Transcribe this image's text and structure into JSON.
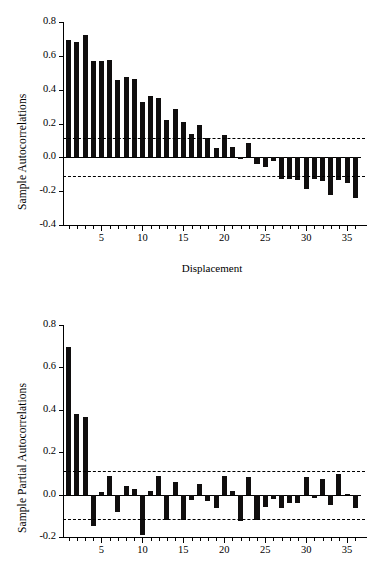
{
  "figure": {
    "background": "#ffffff",
    "bar_color": "#100e0e",
    "axis_color": "#000000"
  },
  "chart_data": [
    {
      "type": "bar",
      "name": "sample-autocorrelations",
      "title": "",
      "ylabel": "Sample Autocorrelations",
      "xlabel": "Displacement",
      "ylim": [
        -0.4,
        0.8
      ],
      "xlim": [
        0.3,
        36.7
      ],
      "grid": false,
      "legend": null,
      "ytick_labels": [
        "0.8",
        "0.6",
        "0.4",
        "0.2",
        "0.0",
        "-0.2",
        "-0.4"
      ],
      "ytick_values": [
        0.8,
        0.6,
        0.4,
        0.2,
        0.0,
        -0.2,
        -0.4
      ],
      "xtick_labels": [
        "5",
        "10",
        "15",
        "20",
        "25",
        "30",
        "35"
      ],
      "xtick_values": [
        5,
        10,
        15,
        20,
        25,
        30,
        35
      ],
      "confidence_bands": [
        0.113,
        -0.113
      ],
      "x": [
        1,
        2,
        3,
        4,
        5,
        6,
        7,
        8,
        9,
        10,
        11,
        12,
        13,
        14,
        15,
        16,
        17,
        18,
        19,
        20,
        21,
        22,
        23,
        24,
        25,
        26,
        27,
        28,
        29,
        30,
        31,
        32,
        33,
        34,
        35,
        36
      ],
      "values": [
        0.695,
        0.683,
        0.722,
        0.567,
        0.567,
        0.576,
        0.458,
        0.474,
        0.461,
        0.325,
        0.36,
        0.352,
        0.223,
        0.288,
        0.208,
        0.136,
        0.192,
        0.113,
        0.055,
        0.13,
        0.064,
        -0.012,
        0.082,
        -0.04,
        -0.06,
        -0.022,
        -0.128,
        -0.13,
        -0.135,
        -0.185,
        -0.128,
        -0.14,
        -0.222,
        -0.135,
        -0.15,
        -0.24
      ]
    },
    {
      "type": "bar",
      "name": "sample-partial-autocorrelations",
      "title": "",
      "ylabel": "Sample Partial Autocorrelations",
      "xlabel": "",
      "ylim": [
        -0.2,
        0.8
      ],
      "xlim": [
        0.3,
        36.7
      ],
      "grid": false,
      "legend": null,
      "ytick_labels": [
        "0.8",
        "0.6",
        "0.4",
        "0.2",
        "0.0",
        "-0.2"
      ],
      "ytick_values": [
        0.8,
        0.6,
        0.4,
        0.2,
        0.0,
        -0.2
      ],
      "xtick_labels": [
        "5",
        "10",
        "15",
        "20",
        "25",
        "30",
        "35"
      ],
      "xtick_values": [
        5,
        10,
        15,
        20,
        25,
        30,
        35
      ],
      "confidence_bands": [
        0.113,
        -0.113
      ],
      "x": [
        1,
        2,
        3,
        4,
        5,
        6,
        7,
        8,
        9,
        10,
        11,
        12,
        13,
        14,
        15,
        16,
        17,
        18,
        19,
        20,
        21,
        22,
        23,
        24,
        25,
        26,
        27,
        28,
        29,
        30,
        31,
        32,
        33,
        34,
        35,
        36
      ],
      "values": [
        0.695,
        0.382,
        0.368,
        -0.148,
        0.012,
        0.09,
        -0.08,
        0.04,
        0.025,
        -0.19,
        0.015,
        0.088,
        -0.118,
        0.06,
        -0.118,
        -0.025,
        0.048,
        -0.028,
        -0.065,
        0.09,
        0.015,
        -0.125,
        0.085,
        -0.122,
        -0.058,
        -0.022,
        -0.065,
        -0.038,
        -0.042,
        0.082,
        -0.018,
        0.072,
        -0.048,
        0.098,
        0.005,
        -0.062
      ]
    }
  ]
}
